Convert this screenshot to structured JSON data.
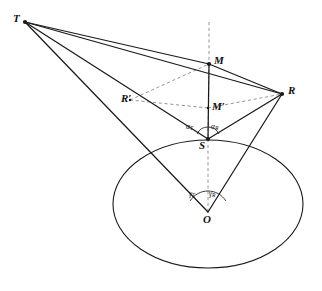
{
  "figure": {
    "kind": "geometry-diagram",
    "background_color": "#ffffff",
    "stroke_color": "#1a1a1a",
    "dash_color": "#8a8a8a",
    "width": 322,
    "height": 291
  },
  "points": {
    "T": {
      "label": "T",
      "x": 25,
      "y": 22
    },
    "M": {
      "label": "M",
      "x": 209,
      "y": 64
    },
    "R": {
      "label": "R",
      "x": 282,
      "y": 94
    },
    "Rprime": {
      "label": "R′",
      "x": 130,
      "y": 100
    },
    "Mprime": {
      "label": "M′",
      "x": 208,
      "y": 108
    },
    "S": {
      "label": "S",
      "x": 208,
      "y": 139
    },
    "O": {
      "label": "O",
      "x": 208,
      "y": 212
    }
  },
  "point_labels": [
    {
      "name": "point-label-T",
      "text": "T",
      "x": 13,
      "y": 13
    },
    {
      "name": "point-label-M",
      "text": "M",
      "x": 214,
      "y": 55
    },
    {
      "name": "point-label-R",
      "text": "R",
      "x": 288,
      "y": 85
    },
    {
      "name": "point-label-R-prime",
      "text": "R′",
      "x": 121,
      "y": 93
    },
    {
      "name": "point-label-M-prime",
      "text": "M′",
      "x": 212,
      "y": 101
    },
    {
      "name": "point-label-S",
      "text": "S",
      "x": 199,
      "y": 140
    },
    {
      "name": "point-label-O",
      "text": "O",
      "x": 203,
      "y": 214
    }
  ],
  "angle_labels": [
    {
      "name": "angle-alpha-T",
      "base": "α",
      "sub": "T",
      "x": 186,
      "y": 123
    },
    {
      "name": "angle-alpha-R",
      "base": "α",
      "sub": "R",
      "x": 211,
      "y": 123
    },
    {
      "name": "angle-gamma-T",
      "base": "γ",
      "sub": "T",
      "x": 189,
      "y": 190
    },
    {
      "name": "angle-gamma-R",
      "base": "γ",
      "sub": "R",
      "x": 209,
      "y": 190
    }
  ],
  "solid_segments": [
    {
      "name": "segment-T-M",
      "from": "T",
      "to": "M"
    },
    {
      "name": "segment-T-R",
      "from": "T",
      "to": "R"
    },
    {
      "name": "segment-T-S",
      "from": "T",
      "to": "S"
    },
    {
      "name": "segment-T-O",
      "from": "T",
      "to": "O"
    },
    {
      "name": "segment-M-R",
      "from": "M",
      "to": "R"
    },
    {
      "name": "segment-R-S",
      "from": "R",
      "to": "S"
    },
    {
      "name": "segment-R-O",
      "from": "R",
      "to": "O"
    },
    {
      "name": "segment-S-M",
      "from": "S",
      "to": "M"
    }
  ],
  "dashed_segments": [
    {
      "name": "dashed-axis-upper",
      "x1": 209,
      "y1": 22,
      "x2": 209,
      "y2": 64
    },
    {
      "name": "dashed-axis-M-to-S",
      "x1": 209,
      "y1": 64,
      "x2": 208,
      "y2": 139
    },
    {
      "name": "dashed-axis-S-to-O",
      "x1": 208,
      "y1": 139,
      "x2": 208,
      "y2": 212
    },
    {
      "name": "dashed-M-prime-to-R-prime",
      "x1": 208,
      "y1": 108,
      "x2": 130,
      "y2": 100
    },
    {
      "name": "dashed-R-prime-to-M",
      "x1": 130,
      "y1": 100,
      "x2": 209,
      "y2": 64
    },
    {
      "name": "dashed-M-prime-to-R",
      "x1": 208,
      "y1": 108,
      "x2": 282,
      "y2": 94
    }
  ],
  "ellipse": {
    "name": "base-ellipse",
    "cx": 208,
    "cy": 204,
    "rx": 95,
    "ry": 64
  },
  "angle_arcs": [
    {
      "name": "angle-arc-at-S",
      "cx": 208,
      "cy": 139,
      "r": 12,
      "start_deg": 205,
      "end_deg": 335
    },
    {
      "name": "angle-arc-at-O",
      "cx": 208,
      "cy": 212,
      "r": 21,
      "start_deg": 212,
      "end_deg": 328
    }
  ],
  "vertex_dots": [
    {
      "name": "vertex-dot-T",
      "x": 25,
      "y": 22,
      "r": 2.1
    },
    {
      "name": "vertex-dot-M",
      "x": 209,
      "y": 64,
      "r": 2.1
    },
    {
      "name": "vertex-dot-R",
      "x": 282,
      "y": 94,
      "r": 2.1
    },
    {
      "name": "vertex-dot-S",
      "x": 208,
      "y": 139,
      "r": 2.1
    },
    {
      "name": "vertex-dot-M-prime",
      "x": 208,
      "y": 108,
      "r": 1.2
    },
    {
      "name": "vertex-dot-R-prime",
      "x": 130,
      "y": 100,
      "r": 1.2
    }
  ]
}
